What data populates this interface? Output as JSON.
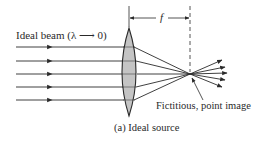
{
  "figure": {
    "beam_label": "Ideal beam (λ ⟶ 0)",
    "focal_length_label": "f",
    "image_label": "Fictitious, point image",
    "caption": "(a)  Ideal source"
  },
  "geometry": {
    "ray_y": [
      47,
      61,
      74,
      87,
      100
    ],
    "ray_start_x": 16,
    "lens_center_x": 129,
    "lens_top_y": 28,
    "lens_bottom_y": 116,
    "focal_point": [
      190,
      74
    ],
    "dashed_line_x": 190
  },
  "colors": {
    "line": "#2a2a2a",
    "lens_fill": "#c4c4c4",
    "background": "#ffffff"
  }
}
